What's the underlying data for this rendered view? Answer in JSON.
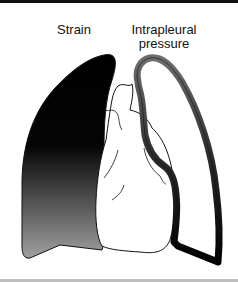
{
  "figure": {
    "labels": {
      "strain": "Strain",
      "intrapleural_line1": "Intrapleural",
      "intrapleural_line2": "pressure"
    },
    "colors": {
      "gradient_top": "#000000",
      "gradient_bottom": "#9a9a9a",
      "pleural_top": "#707070",
      "pleural_bottom": "#000000",
      "outline": "#111111"
    }
  }
}
